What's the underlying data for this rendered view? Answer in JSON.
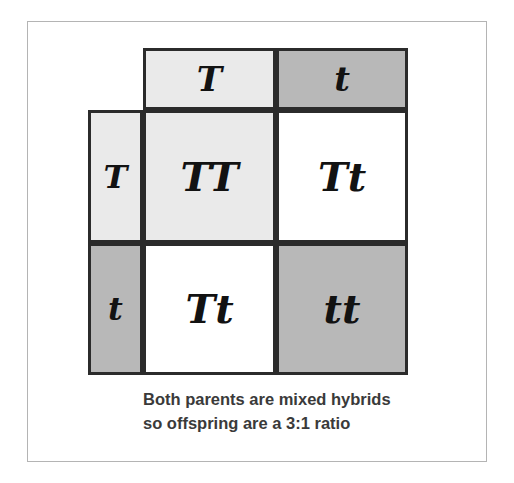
{
  "diagram": {
    "type": "punnett-square",
    "colors": {
      "light_gray": "#eaeaea",
      "medium_gray": "#b8b8b8",
      "white": "#ffffff",
      "grid_line": "#2b2b2b",
      "frame": "#b4b4b4",
      "text": "#121212",
      "caption_text": "#3a3a3a"
    },
    "column_headers": [
      {
        "allele": "T",
        "fill": "light_gray"
      },
      {
        "allele": "t",
        "fill": "medium_gray"
      }
    ],
    "row_headers": [
      {
        "allele": "T",
        "fill": "light_gray"
      },
      {
        "allele": "t",
        "fill": "medium_gray"
      }
    ],
    "cells": [
      [
        {
          "genotype": "TT",
          "fill": "light_gray"
        },
        {
          "genotype": "Tt",
          "fill": "white"
        }
      ],
      [
        {
          "genotype": "Tt",
          "fill": "white"
        },
        {
          "genotype": "tt",
          "fill": "medium_gray"
        }
      ]
    ],
    "caption": {
      "line1": "Both parents are mixed hybrids",
      "line2": "so offspring are a 3:1 ratio"
    }
  }
}
